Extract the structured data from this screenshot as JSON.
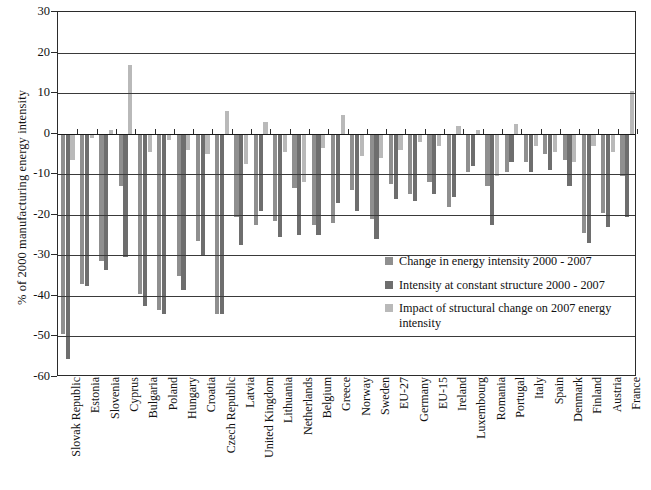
{
  "chart_data": {
    "type": "bar",
    "title": "",
    "xlabel": "",
    "ylabel": "% of 2000 manufacturing energy intensity",
    "ylim": [
      -60,
      30
    ],
    "ytick_step": 10,
    "yticks": [
      30,
      20,
      10,
      0,
      -10,
      -20,
      -30,
      -40,
      -50,
      -60
    ],
    "grid": true,
    "legend_position": "inside-right",
    "colors": {
      "series1": "#8f8f8f",
      "series2": "#6e6e6e",
      "series3": "#b9b9b9",
      "axis": "#2b2b2b",
      "grid": "#3a3a3a",
      "text": "#111111",
      "background": "#ffffff"
    },
    "categories": [
      "Slovak Republic",
      "Estonia",
      "Slovenia",
      "Cyprus",
      "Bulgaria",
      "Poland",
      "Hungary",
      "Croatia",
      "Czech Republic",
      "Latvia",
      "United Kingdom",
      "Lithuania",
      "Netherlands",
      "Belgium",
      "Greece",
      "Norway",
      "Sweden",
      "EU-27",
      "Germany",
      "EU-15",
      "Ireland",
      "Luxembourg",
      "Romania",
      "Portugal",
      "Italy",
      "Spain",
      "Denmark",
      "Finland",
      "Austria",
      "France"
    ],
    "series": [
      {
        "name": "Change in energy intensity 2000 - 2007",
        "color": "#8f8f8f",
        "values": [
          -49.5,
          -37.0,
          -31.5,
          -13.0,
          -39.5,
          -43.5,
          -35.0,
          -26.5,
          -44.5,
          -20.5,
          -22.5,
          -21.5,
          -13.5,
          -22.5,
          -22.0,
          -14.0,
          -21.0,
          -12.5,
          -15.0,
          -12.0,
          -18.0,
          -9.5,
          -13.0,
          -9.5,
          -7.0,
          -5.0,
          -6.5,
          -24.5,
          -19.5,
          -10.5
        ]
      },
      {
        "name": "Intensity at constant structure 2000 - 2007",
        "color": "#6e6e6e",
        "values": [
          -55.5,
          -37.5,
          -33.5,
          -30.5,
          -42.5,
          -44.5,
          -38.5,
          -30.0,
          -44.5,
          -27.5,
          -19.0,
          -25.5,
          -25.0,
          -25.0,
          -17.0,
          -19.0,
          -26.0,
          -16.0,
          -16.5,
          -15.0,
          -15.5,
          -8.0,
          -22.5,
          -7.0,
          -9.5,
          -9.0,
          -13.0,
          -27.0,
          -23.0,
          -20.5
        ]
      },
      {
        "name": "Impact of structural change on 2007 energy intensity",
        "color": "#b9b9b9",
        "values": [
          -6.5,
          -1.0,
          1.0,
          17.0,
          -4.5,
          -1.5,
          -4.0,
          -5.0,
          5.5,
          -7.5,
          3.0,
          -4.5,
          -12.0,
          -3.5,
          4.5,
          -5.5,
          -6.0,
          -4.0,
          -2.0,
          -3.0,
          2.0,
          1.0,
          -10.5,
          2.5,
          -3.0,
          -4.5,
          -7.0,
          -3.0,
          -4.5,
          10.5
        ]
      }
    ]
  },
  "legend": {
    "items": [
      {
        "label": "Change in energy intensity 2000 - 2007",
        "color": "#8f8f8f"
      },
      {
        "label": "Intensity at constant structure 2000 - 2007",
        "color": "#6e6e6e"
      },
      {
        "label": "Impact of structural change on 2007 energy intensity",
        "color": "#b9b9b9"
      }
    ]
  }
}
